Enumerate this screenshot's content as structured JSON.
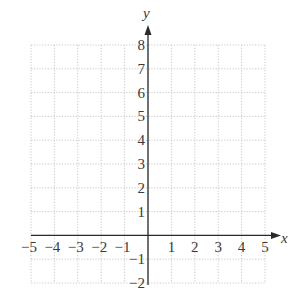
{
  "chart_data": {
    "type": "scatter",
    "title": "",
    "subtitle": "",
    "xlabel": "x",
    "ylabel": "y",
    "xlim": [
      -5,
      5
    ],
    "ylim": [
      -2,
      8
    ],
    "x_ticks": [
      -5,
      -4,
      -3,
      -2,
      -1,
      1,
      2,
      3,
      4,
      5
    ],
    "x_tick_labels": [
      "−5",
      "−4",
      "−3",
      "−2",
      "−1",
      "1",
      "2",
      "3",
      "4",
      "5"
    ],
    "y_ticks": [
      -2,
      -1,
      1,
      2,
      3,
      4,
      5,
      6,
      7,
      8
    ],
    "y_tick_labels": [
      "−2",
      "−1",
      "1",
      "2",
      "3",
      "4",
      "5",
      "6",
      "7",
      "8"
    ],
    "grid": true,
    "grid_style": "dotted",
    "legend": null,
    "series": []
  },
  "colors": {
    "grid": "#c8c8c8",
    "axis": "#2a2a2a",
    "text": "#3a3a3a",
    "background": "#ffffff"
  }
}
